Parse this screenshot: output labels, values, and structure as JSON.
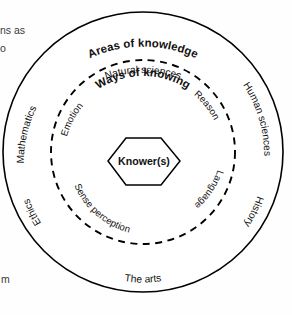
{
  "diagram": {
    "title": "Areas of knowledge",
    "inner_ring_title": "Ways of knowing",
    "center_label": "Knower(s)",
    "areas_of_knowledge": [
      {
        "label": "Natural sciences",
        "position": "top"
      },
      {
        "label": "Human sciences",
        "position": "upper-right"
      },
      {
        "label": "History",
        "position": "lower-right"
      },
      {
        "label": "The arts",
        "position": "bottom"
      },
      {
        "label": "Ethics",
        "position": "lower-left"
      },
      {
        "label": "Mathematics",
        "position": "upper-left"
      }
    ],
    "ways_of_knowing": [
      {
        "label": "Emotion",
        "position": "upper-left"
      },
      {
        "label": "Reason",
        "position": "upper-right"
      },
      {
        "label": "Language",
        "position": "lower-right"
      },
      {
        "label": "Sense perception",
        "position": "lower-left"
      }
    ],
    "edge_fragments": [
      {
        "text": "ns as",
        "position": "top-left"
      },
      {
        "text": "o",
        "position": "top-left-second"
      },
      {
        "text": "m",
        "position": "bottom-left"
      }
    ],
    "colors": {
      "stroke": "#000000",
      "background": "#ffffff",
      "text": "#111111"
    }
  }
}
